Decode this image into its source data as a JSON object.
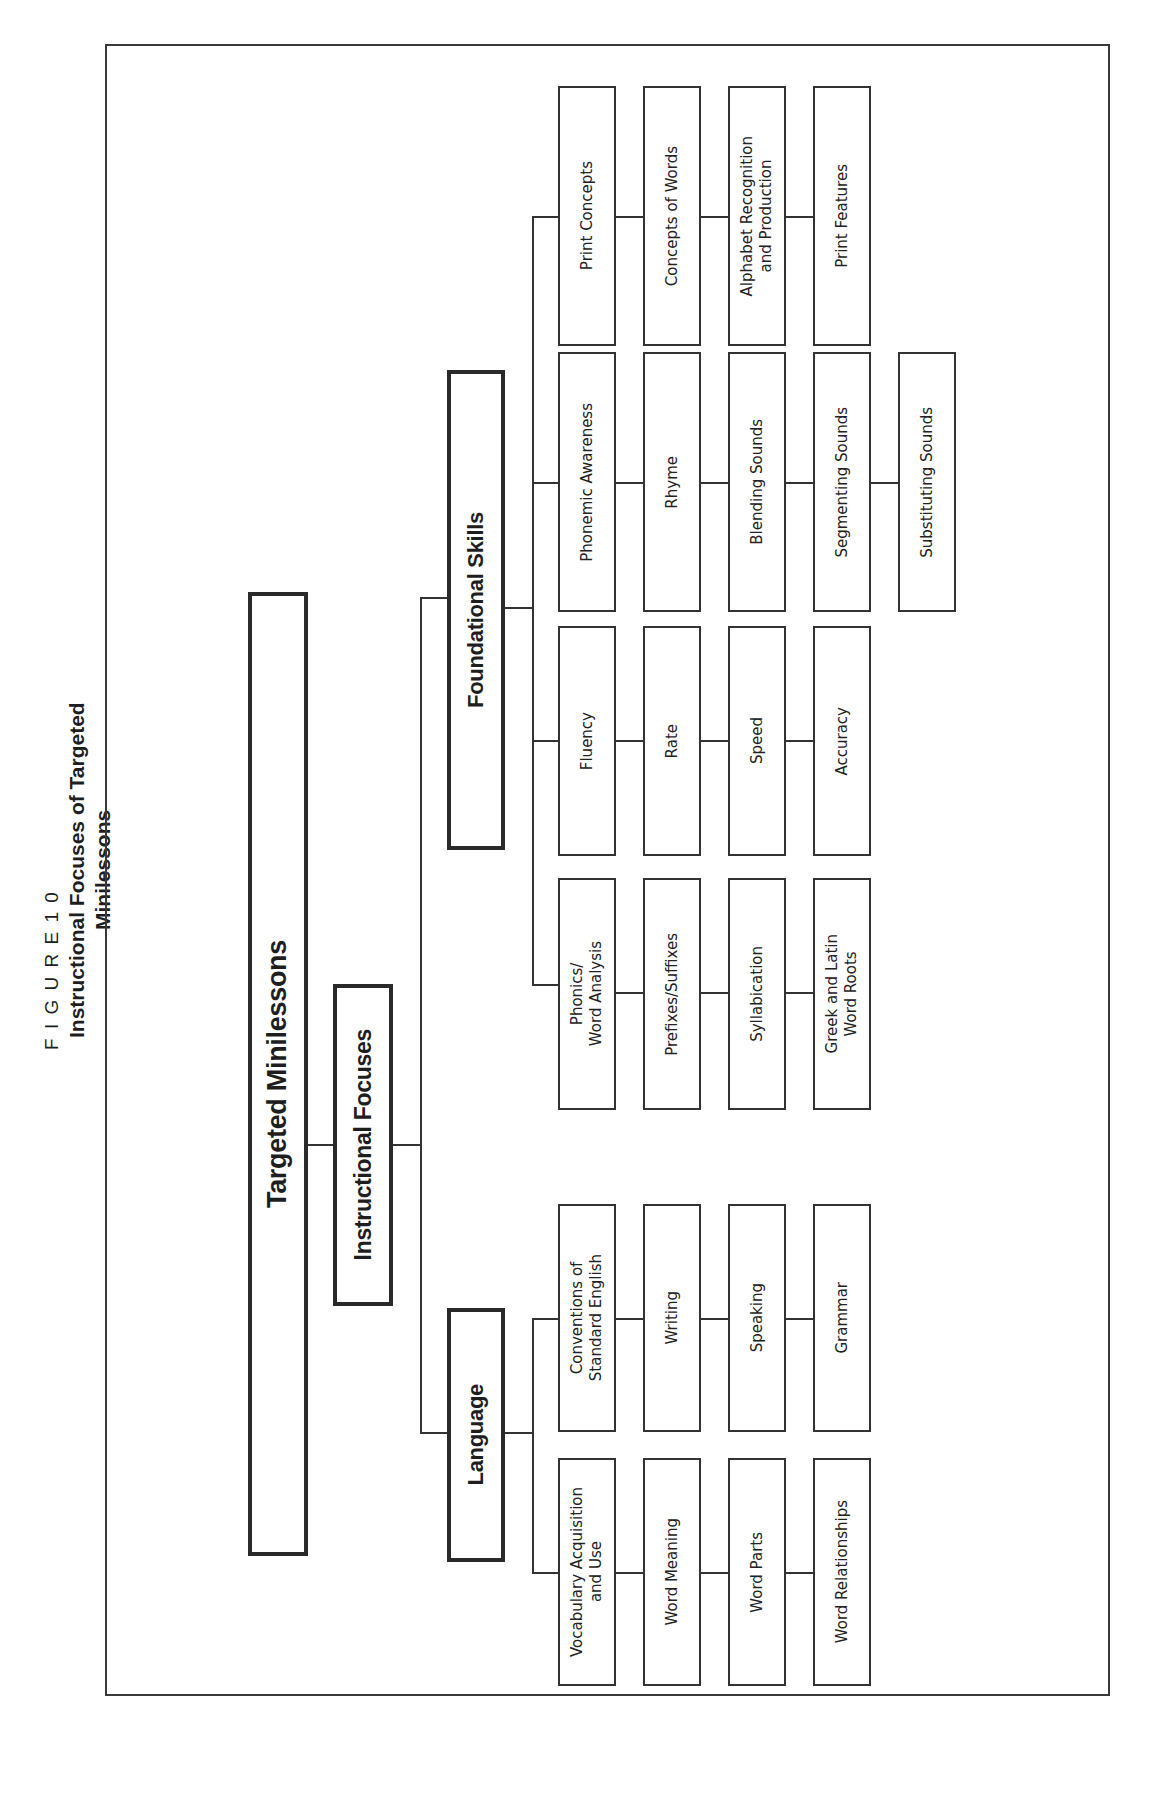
{
  "figure": {
    "label": "F I G U R E   1 0",
    "title": "Instructional Focuses of Targeted Minilessons"
  },
  "root": {
    "label": "Targeted Minilessons"
  },
  "level1": {
    "label": "Instructional Focuses"
  },
  "branches": {
    "language": {
      "label": "Language",
      "columns": [
        {
          "items": [
            "Vocabulary Acquisition\nand Use",
            "Word Meaning",
            "Word Parts",
            "Word Relationships"
          ]
        },
        {
          "items": [
            "Conventions of\nStandard English",
            "Writing",
            "Speaking",
            "Grammar"
          ]
        }
      ]
    },
    "foundational": {
      "label": "Foundational Skills",
      "columns": [
        {
          "items": [
            "Phonics/\nWord Analysis",
            "Prefixes/Suffixes",
            "Syllabication",
            "Greek and Latin\nWord Roots"
          ]
        },
        {
          "items": [
            "Fluency",
            "Rate",
            "Speed",
            "Accuracy"
          ]
        },
        {
          "items": [
            "Phonemic Awareness",
            "Rhyme",
            "Blending Sounds",
            "Segmenting Sounds",
            "Substituting Sounds"
          ]
        },
        {
          "items": [
            "Print Concepts",
            "Concepts of Words",
            "Alphabet Recognition\nand Production",
            "Print Features"
          ]
        }
      ]
    }
  }
}
